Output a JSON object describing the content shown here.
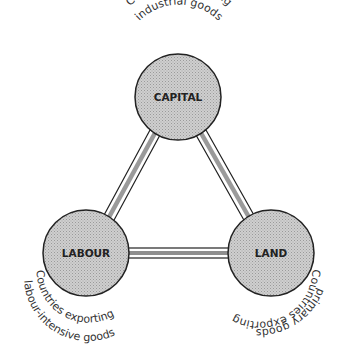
{
  "diagram": {
    "nodes": [
      {
        "id": "capital",
        "label": "CAPITAL",
        "caption_line1": "Countries exporting",
        "caption_line2": "industrial goods"
      },
      {
        "id": "labour",
        "label": "LABOUR",
        "caption_line1": "Countries exporting",
        "caption_line2": "labour-intensive goods"
      },
      {
        "id": "land",
        "label": "LAND",
        "caption_line1": "Countries exporting",
        "caption_line2": "primary goods"
      }
    ],
    "edges": [
      {
        "from": "capital",
        "to": "labour"
      },
      {
        "from": "capital",
        "to": "land"
      },
      {
        "from": "labour",
        "to": "land"
      }
    ],
    "colors": {
      "node_fill": "#c4c4c4",
      "node_stroke": "#222222",
      "edge_fill": "#9a9a9a"
    }
  }
}
